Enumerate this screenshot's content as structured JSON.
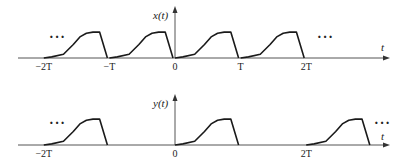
{
  "diagram": {
    "type": "periodic-signal-plot",
    "plots": [
      {
        "id": "x",
        "signal_label": "x(t)",
        "time_axis_label": "t",
        "ticks": [
          {
            "value": -2,
            "label": "−2T"
          },
          {
            "value": -1,
            "label": "−T"
          },
          {
            "value": 0,
            "label": "0"
          },
          {
            "value": 1,
            "label": "T"
          },
          {
            "value": 2,
            "label": "2T"
          }
        ],
        "pulse_starts": [
          -2,
          -1,
          0,
          1
        ],
        "ellipsis_left": "···",
        "ellipsis_right": "···"
      },
      {
        "id": "y",
        "signal_label": "y(t)",
        "time_axis_label": "t",
        "ticks": [
          {
            "value": -2,
            "label": "−2T"
          },
          {
            "value": 0,
            "label": "0"
          },
          {
            "value": 2,
            "label": "2T"
          }
        ],
        "pulse_starts": [
          -2,
          0,
          2
        ],
        "ellipsis_left": "···",
        "ellipsis_right": "···"
      }
    ]
  }
}
